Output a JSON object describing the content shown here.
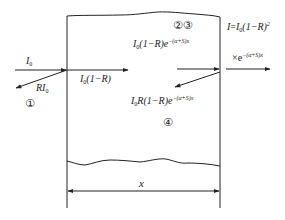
{
  "diagram": {
    "colors": {
      "line": "#222222",
      "background": "#ffffff"
    },
    "labels": {
      "incident": {
        "base": "I",
        "sub": "0"
      },
      "reflected_front": {
        "prefix": "R",
        "base": "I",
        "sub": "0"
      },
      "transmitted_front": {
        "base": "I",
        "sub": "0",
        "rest": "(1−R)"
      },
      "attenuated_inside": {
        "base": "I",
        "sub": "0",
        "rest": "(1−R)e",
        "sup": "−(α+S)x"
      },
      "reflected_back_inside": {
        "base": "I",
        "sub": "0",
        "rest": "R(1−R)e",
        "sup": "−(α+S)x"
      },
      "output_equation": {
        "lhs": "I",
        "eq": "=",
        "base": "I",
        "sub": "0",
        "rest": "(1−R)",
        "sup": "2"
      },
      "output_factor": {
        "times": "×e",
        "sup": "−(α+S)x"
      },
      "dimension": "x"
    },
    "region_markers": {
      "m1": "①",
      "m23": "②③",
      "m4": "④"
    }
  }
}
